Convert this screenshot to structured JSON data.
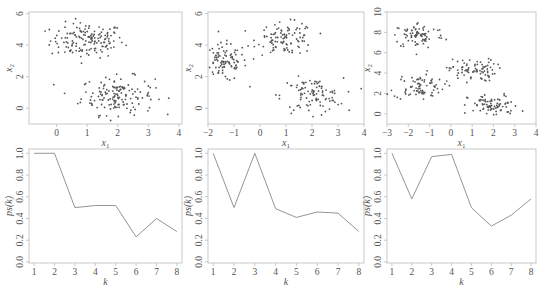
{
  "figure": {
    "layout": "2x3 grid",
    "frame_color": "#bbbbbb",
    "point_color": "#555555",
    "line_color": "#888888"
  },
  "chart_data": [
    {
      "id": "scatter-2-clusters",
      "type": "scatter",
      "title": "",
      "xlabel": "x1",
      "ylabel": "x2",
      "xlim": [
        -0.9,
        4.1
      ],
      "ylim": [
        -1.0,
        6.1
      ],
      "xticks": [
        0,
        1,
        2,
        3,
        4
      ],
      "yticks": [
        0,
        2,
        4,
        6
      ],
      "clusters": [
        {
          "center": [
            1.0,
            4.3
          ],
          "spread": [
            0.6,
            0.55
          ],
          "n": 150
        },
        {
          "center": [
            2.0,
            0.8
          ],
          "spread": [
            0.6,
            0.6
          ],
          "n": 150
        }
      ],
      "frame": {
        "x": 29,
        "y": 12,
        "w": 153,
        "h": 112
      }
    },
    {
      "id": "scatter-3-clusters",
      "type": "scatter",
      "title": "",
      "xlabel": "x1",
      "ylabel": "x2",
      "xlim": [
        -2.0,
        4.0
      ],
      "ylim": [
        -1.0,
        6.1
      ],
      "xticks": [
        -2,
        -1,
        0,
        1,
        2,
        3,
        4
      ],
      "yticks": [
        0,
        2,
        4,
        6
      ],
      "clusters": [
        {
          "center": [
            -1.4,
            2.9
          ],
          "spread": [
            0.45,
            0.6
          ],
          "n": 100
        },
        {
          "center": [
            1.0,
            4.4
          ],
          "spread": [
            0.55,
            0.5
          ],
          "n": 100
        },
        {
          "center": [
            2.0,
            0.8
          ],
          "spread": [
            0.6,
            0.55
          ],
          "n": 100
        }
      ],
      "frame": {
        "x": 208,
        "y": 12,
        "w": 156,
        "h": 112
      }
    },
    {
      "id": "scatter-4-clusters",
      "type": "scatter",
      "title": "",
      "xlabel": "x1",
      "ylabel": "x2",
      "xlim": [
        -3.0,
        4.0
      ],
      "ylim": [
        -1.0,
        10.0
      ],
      "xticks": [
        -3,
        -2,
        -1,
        0,
        1,
        2,
        3,
        4
      ],
      "yticks": [
        0,
        2,
        4,
        6,
        8,
        10
      ],
      "clusters": [
        {
          "center": [
            -1.5,
            7.7
          ],
          "spread": [
            0.6,
            0.65
          ],
          "n": 80
        },
        {
          "center": [
            -1.5,
            2.7
          ],
          "spread": [
            0.6,
            0.65
          ],
          "n": 80
        },
        {
          "center": [
            1.0,
            4.3
          ],
          "spread": [
            0.55,
            0.55
          ],
          "n": 80
        },
        {
          "center": [
            2.0,
            0.8
          ],
          "spread": [
            0.6,
            0.55
          ],
          "n": 80
        }
      ],
      "frame": {
        "x": 387,
        "y": 12,
        "w": 149,
        "h": 112
      }
    },
    {
      "id": "ps-2-clusters",
      "type": "line",
      "title": "",
      "xlabel": "k",
      "ylabel": "ps(k)",
      "x": [
        1,
        2,
        3,
        4,
        5,
        6,
        7,
        8
      ],
      "values": [
        1.0,
        1.0,
        0.5,
        0.52,
        0.52,
        0.23,
        0.4,
        0.28
      ],
      "xlim": [
        0.75,
        8.25
      ],
      "ylim": [
        -0.01,
        1.04
      ],
      "xticks": [
        1,
        2,
        3,
        4,
        5,
        6,
        7,
        8
      ],
      "yticks": [
        "0.0",
        "0.2",
        "0.4",
        "0.6",
        "0.8",
        "1.0"
      ],
      "frame": {
        "x": 29,
        "y": 149,
        "w": 153,
        "h": 114
      }
    },
    {
      "id": "ps-3-clusters",
      "type": "line",
      "title": "",
      "xlabel": "k",
      "ylabel": "ps(k)",
      "x": [
        1,
        2,
        3,
        4,
        5,
        6,
        7,
        8
      ],
      "values": [
        1.0,
        0.5,
        1.0,
        0.49,
        0.41,
        0.46,
        0.45,
        0.28
      ],
      "xlim": [
        0.75,
        8.25
      ],
      "ylim": [
        -0.01,
        1.04
      ],
      "xticks": [
        1,
        2,
        3,
        4,
        5,
        6,
        7,
        8
      ],
      "yticks": [
        "0.0",
        "0.2",
        "0.4",
        "0.6",
        "0.8",
        "1.0"
      ],
      "frame": {
        "x": 208,
        "y": 149,
        "w": 156,
        "h": 114
      }
    },
    {
      "id": "ps-4-clusters",
      "type": "line",
      "title": "",
      "xlabel": "k",
      "ylabel": "ps(k)",
      "x": [
        1,
        2,
        3,
        4,
        5,
        6,
        7,
        8
      ],
      "values": [
        1.0,
        0.58,
        0.97,
        0.99,
        0.5,
        0.33,
        0.43,
        0.58
      ],
      "xlim": [
        0.75,
        8.25
      ],
      "ylim": [
        -0.01,
        1.04
      ],
      "xticks": [
        1,
        2,
        3,
        4,
        5,
        6,
        7,
        8
      ],
      "yticks": [
        "0.0",
        "0.2",
        "0.4",
        "0.6",
        "0.8",
        "1.0"
      ],
      "frame": {
        "x": 387,
        "y": 149,
        "w": 149,
        "h": 114
      }
    }
  ]
}
